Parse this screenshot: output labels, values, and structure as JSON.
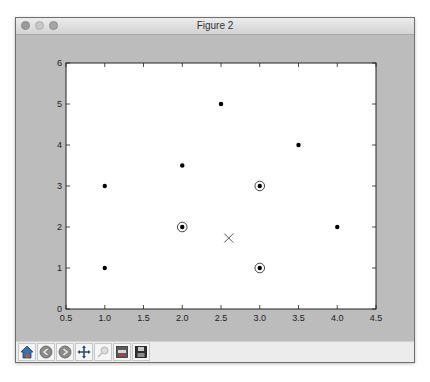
{
  "window": {
    "title": "Figure 2"
  },
  "toolbar": {
    "buttons": [
      {
        "name": "home",
        "icon": "home-icon"
      },
      {
        "name": "back",
        "icon": "back-arrow-icon"
      },
      {
        "name": "forward",
        "icon": "forward-arrow-icon"
      },
      {
        "name": "pan",
        "icon": "pan-move-icon"
      },
      {
        "name": "zoom",
        "icon": "zoom-rect-icon"
      },
      {
        "name": "configure-subplots",
        "icon": "subplots-icon"
      },
      {
        "name": "save",
        "icon": "save-floppy-icon"
      }
    ]
  },
  "colors": {
    "canvas_bg": "#bcbcbc",
    "plot_bg": "#ffffff",
    "marker": "#000000",
    "centroid_marker": "#555555"
  },
  "chart_data": {
    "type": "scatter",
    "title": "",
    "xlabel": "",
    "ylabel": "",
    "xlim": [
      0.5,
      4.5
    ],
    "ylim": [
      0,
      6
    ],
    "xticks": [
      "0.5",
      "1.0",
      "1.5",
      "2.0",
      "2.5",
      "3.0",
      "3.5",
      "4.0",
      "4.5"
    ],
    "yticks": [
      "0",
      "1",
      "2",
      "3",
      "4",
      "5",
      "6"
    ],
    "grid": false,
    "legend": null,
    "series": [
      {
        "name": "points",
        "marker": "dot",
        "x": [
          1.0,
          1.0,
          2.0,
          2.5,
          3.5,
          4.0
        ],
        "y": [
          3.0,
          1.0,
          3.5,
          5.0,
          4.0,
          2.0
        ]
      },
      {
        "name": "circled points",
        "marker": "circled-dot",
        "x": [
          2.0,
          3.0,
          3.0
        ],
        "y": [
          2.0,
          3.0,
          1.0
        ]
      },
      {
        "name": "centroid",
        "marker": "x",
        "x": [
          2.6
        ],
        "y": [
          1.73
        ]
      }
    ]
  }
}
